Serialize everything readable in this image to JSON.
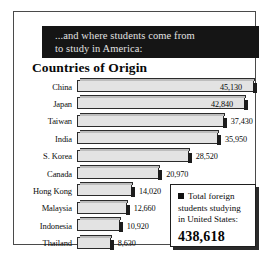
{
  "banner": {
    "line1": "...and where students come from",
    "line2": "to study in America:"
  },
  "heading": "Countries of Origin",
  "legend": {
    "marker": "legend-square",
    "line1": "Total foreign",
    "line2": "students studying",
    "line3": "in United States:",
    "total": "438,618"
  },
  "chart_data": {
    "type": "bar",
    "orientation": "horizontal",
    "title": "Countries of Origin",
    "subtitle": "...and where students come from to study in America:",
    "xlabel": "",
    "ylabel": "",
    "grid": false,
    "legend_position": "bottom-right",
    "xlim": [
      0,
      45130
    ],
    "categories": [
      "China",
      "Japan",
      "Taiwan",
      "India",
      "S. Korea",
      "Canada",
      "Hong Kong",
      "Malaysia",
      "Indonesia",
      "Thailand"
    ],
    "values": [
      45130,
      42840,
      37430,
      35950,
      28520,
      20970,
      14020,
      12660,
      10920,
      8630
    ],
    "value_labels": [
      "45,130",
      "42,840",
      "37,430",
      "35,950",
      "28,520",
      "20,970",
      "14,020",
      "12,660",
      "10,920",
      "8,630"
    ],
    "annotations": [
      "Total foreign students studying in United States: 438,618"
    ],
    "total": 438618
  },
  "colors": {
    "banner_bg": "#151515",
    "banner_text": "#e2e2e2",
    "bar_face": "#e3e3e3",
    "bar_edge": "#2b2b2b",
    "bar_shadow": "#1c1c1c",
    "frame": "#4a4a4a",
    "text": "#0a0a0a"
  }
}
